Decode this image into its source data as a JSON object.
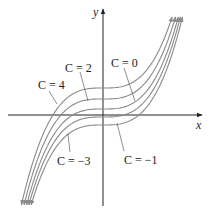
{
  "figure": {
    "axes": {
      "x_label": "x",
      "y_label": "y"
    },
    "curves": [
      {
        "c": 4,
        "label": "C = 4",
        "y0": 88
      },
      {
        "c": 2,
        "label": "C = 2",
        "y0": 99
      },
      {
        "c": 0,
        "label": "C = 0",
        "y0": 109
      },
      {
        "c": -1,
        "label": "C = −1",
        "y0": 117
      },
      {
        "c": -3,
        "label": "C = −3",
        "y0": 125
      }
    ],
    "labels": {
      "c4": "C = 4",
      "c2": "C = 2",
      "c0": "C = 0",
      "cm1": "C = −1",
      "cm3": "C = −3"
    },
    "colors": {
      "curve": "#8a8a8a",
      "axis": "#222222",
      "text": "#222222"
    }
  }
}
